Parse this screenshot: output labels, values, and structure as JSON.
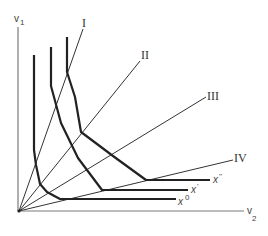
{
  "diagram": {
    "type": "isoquant-activity-rays",
    "colors": {
      "axis": "#7a7a7a",
      "ray": "#333333",
      "isoquant": "#222222",
      "background": "#ffffff"
    },
    "axes": {
      "y_label": "v",
      "y_sub": "1",
      "x_label": "v",
      "x_sub": "2"
    },
    "rays": [
      {
        "label": "I"
      },
      {
        "label": "II"
      },
      {
        "label": "III"
      },
      {
        "label": "IV"
      }
    ],
    "isoquants": [
      {
        "label": "x",
        "sup": "0"
      },
      {
        "label": "x",
        "sup": "'"
      },
      {
        "label": "x",
        "sup": "''"
      }
    ]
  }
}
